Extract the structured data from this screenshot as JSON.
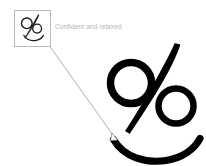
{
  "canvas": {
    "width": 206,
    "height": 166,
    "background_color": "#ffffff"
  },
  "thumbnail": {
    "name": "drawing-thumbnail",
    "border_color": "#b9b9b9",
    "fill_color": "#ffffff",
    "stroke_color": "#1a1a1a",
    "x": 14,
    "y": 10,
    "w": 37,
    "h": 37
  },
  "caption": {
    "text": "Confident and relaxed",
    "color": "#b3b3b3"
  },
  "leader_line": {
    "name": "leader-line",
    "color": "#9a9a9a",
    "start_x": 50,
    "start_y": 46,
    "end_x": 116,
    "end_y": 139,
    "arrow": "small-circle-arrowhead"
  },
  "artwork": {
    "name": "percent-face-drawing",
    "stroke_color": "#000000",
    "description": "percent-sign face with two circular eyes, tapered diagonal stroke and smile arc",
    "left_eye": {
      "cx": 131,
      "cy": 83,
      "r": 21
    },
    "right_eye": {
      "cx": 176,
      "cy": 106,
      "r": 18
    },
    "smile": {
      "x_start": 113,
      "x_end": 200,
      "y_bottom": 157
    }
  }
}
